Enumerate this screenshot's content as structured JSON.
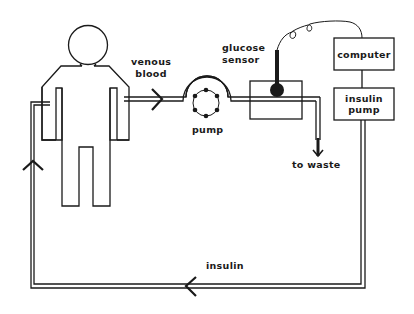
{
  "diagram": {
    "type": "flow-schematic",
    "labels": {
      "venous_blood_line1": "venous",
      "venous_blood_line2": "blood",
      "pump": "pump",
      "glucose_sensor_line1": "glucose",
      "glucose_sensor_line2": "sensor",
      "to_waste": "to waste",
      "computer": "computer",
      "insulin_pump_line1": "insulin",
      "insulin_pump_line2": "pump",
      "insulin": "insulin"
    },
    "nodes": [
      {
        "id": "human",
        "label": "human figure"
      },
      {
        "id": "pump",
        "label": "pump"
      },
      {
        "id": "glucose-sensor",
        "label": "glucose sensor"
      },
      {
        "id": "computer",
        "label": "computer"
      },
      {
        "id": "insulin-pump",
        "label": "insulin pump"
      },
      {
        "id": "waste",
        "label": "to waste"
      }
    ],
    "edges": [
      {
        "from": "human",
        "to": "pump",
        "label": "venous blood"
      },
      {
        "from": "pump",
        "to": "glucose-sensor",
        "label": ""
      },
      {
        "from": "glucose-sensor",
        "to": "waste",
        "label": "to waste"
      },
      {
        "from": "glucose-sensor",
        "to": "computer",
        "label": "signal cable"
      },
      {
        "from": "computer",
        "to": "insulin-pump",
        "label": ""
      },
      {
        "from": "insulin-pump",
        "to": "human",
        "label": "insulin"
      }
    ],
    "colors": {
      "stroke": "#1a1a1a",
      "background": "#ffffff"
    }
  }
}
